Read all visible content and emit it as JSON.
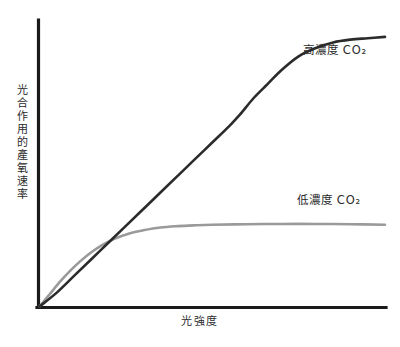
{
  "chart_data": {
    "type": "line",
    "title": "",
    "subtitle": "",
    "xlabel": "光強度",
    "ylabel": "光合作用的產氧速率",
    "xlim": [
      0,
      100
    ],
    "ylim": [
      0,
      100
    ],
    "grid": false,
    "x_tick_labels": [],
    "y_tick_labels": [],
    "legend_position": "inline-right",
    "axis_color": "#1a1a1a",
    "series": [
      {
        "name": "高濃度 CO2",
        "label": "高濃度 CO₂",
        "color": "#2b2b2b",
        "annotation": "高濃度 CO₂",
        "x": [
          0,
          5,
          10,
          15,
          20,
          25,
          30,
          35,
          40,
          45,
          50,
          55,
          58,
          62,
          66,
          70,
          75,
          80,
          85,
          90,
          95,
          100
        ],
        "values": [
          0,
          5,
          11,
          17,
          23,
          29,
          35,
          41,
          47,
          53,
          59,
          65,
          69,
          75,
          80,
          85,
          90,
          93,
          95,
          96,
          96.5,
          97
        ]
      },
      {
        "name": "低濃度 CO2",
        "label": "低濃度 CO₂",
        "color": "#9a9a9a",
        "annotation": "低濃度 CO₂",
        "x": [
          0,
          3,
          6,
          9,
          12,
          15,
          18,
          22,
          26,
          30,
          35,
          40,
          45,
          50,
          60,
          70,
          80,
          90,
          100
        ],
        "values": [
          0,
          4.5,
          9,
          13,
          16.5,
          19.5,
          22,
          24.5,
          26.3,
          27.4,
          28.4,
          28.9,
          29.2,
          29.4,
          29.6,
          29.7,
          29.7,
          29.6,
          29.4
        ]
      }
    ]
  },
  "axes": {
    "y_axis_name": "y-axis",
    "x_axis_name": "x-axis"
  }
}
